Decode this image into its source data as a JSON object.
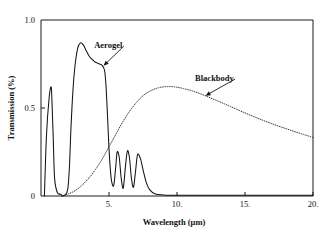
{
  "figure": {
    "background_color": "#ffffff",
    "line_color": "#141414"
  },
  "chart_data": {
    "type": "line",
    "title": "",
    "xlabel": "Wavelength (μm)",
    "ylabel": "Transmission (%)",
    "xlim": [
      0,
      20
    ],
    "ylim": [
      0,
      1.0
    ],
    "xticks": [
      5,
      10,
      15,
      20
    ],
    "xtick_labels": [
      "5.",
      "10.",
      "15.",
      "20."
    ],
    "yticks": [
      0,
      0.5,
      1.0
    ],
    "ytick_labels": [
      "0",
      "0.5",
      "1.0"
    ],
    "grid": false,
    "legend_position": "inline-annotations",
    "annotations": [
      {
        "text": "Aerogel",
        "target_x": 4.6,
        "target_y": 0.74,
        "label_x": 6.2,
        "label_y": 0.86
      },
      {
        "text": "Blackbody",
        "target_x": 12.1,
        "target_y": 0.57,
        "label_x": 14.4,
        "label_y": 0.67
      }
    ],
    "series": [
      {
        "name": "Aerogel",
        "style": "solid",
        "x": [
          0.25,
          0.4,
          0.6,
          0.75,
          0.8,
          0.9,
          1.0,
          1.2,
          1.45,
          1.6,
          1.75,
          1.9,
          2.0,
          2.1,
          2.2,
          2.35,
          2.5,
          2.7,
          2.9,
          3.1,
          3.3,
          3.5,
          3.7,
          3.85,
          4.0,
          4.15,
          4.3,
          4.45,
          4.6,
          4.7,
          4.8,
          4.9,
          5.0,
          5.1,
          5.2,
          5.35,
          5.5,
          5.6,
          5.75,
          5.9,
          6.05,
          6.2,
          6.35,
          6.5,
          6.65,
          6.8,
          6.95,
          7.1,
          7.3,
          7.5,
          7.75,
          8.0,
          8.4,
          9.0,
          10.0,
          12.0,
          14.0,
          16.0,
          18.0,
          20.0
        ],
        "y": [
          0.0,
          0.34,
          0.56,
          0.62,
          0.55,
          0.33,
          0.1,
          0.02,
          0.01,
          0.0,
          0.005,
          0.02,
          0.06,
          0.18,
          0.38,
          0.6,
          0.74,
          0.84,
          0.87,
          0.86,
          0.83,
          0.8,
          0.78,
          0.77,
          0.76,
          0.755,
          0.75,
          0.745,
          0.73,
          0.7,
          0.6,
          0.44,
          0.27,
          0.15,
          0.08,
          0.06,
          0.17,
          0.25,
          0.22,
          0.1,
          0.045,
          0.16,
          0.255,
          0.22,
          0.1,
          0.05,
          0.14,
          0.235,
          0.215,
          0.15,
          0.075,
          0.035,
          0.012,
          0.006,
          0.004,
          0.004,
          0.004,
          0.004,
          0.004,
          0.004
        ]
      },
      {
        "name": "Blackbody",
        "style": "dotted",
        "x": [
          1.5,
          2.0,
          2.5,
          3.0,
          3.5,
          4.0,
          4.5,
          5.0,
          5.5,
          6.0,
          6.5,
          7.0,
          7.5,
          8.0,
          8.5,
          9.0,
          9.5,
          10.0,
          10.5,
          11.0,
          11.5,
          12.0,
          12.5,
          13.0,
          13.5,
          14.0,
          15.0,
          16.0,
          17.0,
          18.0,
          19.0,
          20.0
        ],
        "y": [
          0.0,
          0.012,
          0.03,
          0.06,
          0.1,
          0.15,
          0.21,
          0.28,
          0.35,
          0.42,
          0.48,
          0.53,
          0.57,
          0.595,
          0.612,
          0.62,
          0.622,
          0.618,
          0.61,
          0.6,
          0.587,
          0.572,
          0.556,
          0.54,
          0.523,
          0.506,
          0.472,
          0.44,
          0.41,
          0.383,
          0.357,
          0.333
        ]
      }
    ]
  }
}
